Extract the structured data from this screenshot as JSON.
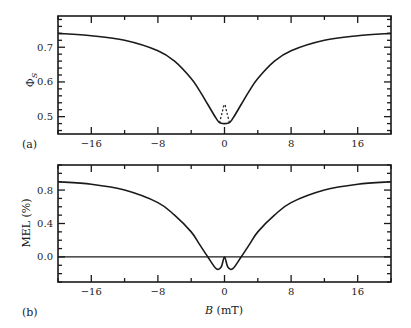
{
  "chart_data": [
    {
      "type": "line",
      "panel_label": "(a)",
      "title": "",
      "xlabel": "",
      "ylabel": "Φ_S",
      "xlim": [
        -20,
        20
      ],
      "ylim": [
        0.45,
        0.79
      ],
      "xticks": [
        -16,
        -8,
        0,
        8,
        16
      ],
      "yticks": [
        0.5,
        0.6,
        0.7
      ],
      "series": [
        {
          "name": "Φ_S (solid)",
          "style": "solid",
          "x": [
            -20,
            -16,
            -12,
            -8,
            -6,
            -4,
            -3,
            -2,
            -1,
            -0.5,
            0.5,
            1,
            2,
            3,
            4,
            6,
            8,
            12,
            16,
            20
          ],
          "y": [
            0.74,
            0.733,
            0.72,
            0.69,
            0.66,
            0.61,
            0.575,
            0.535,
            0.495,
            0.482,
            0.482,
            0.495,
            0.535,
            0.575,
            0.61,
            0.66,
            0.69,
            0.72,
            0.733,
            0.74
          ]
        },
        {
          "name": "Φ_S (dashed, low-field)",
          "style": "dashed",
          "x": [
            -0.6,
            -0.3,
            0,
            0.3,
            0.6
          ],
          "y": [
            0.482,
            0.51,
            0.535,
            0.51,
            0.482
          ]
        }
      ]
    },
    {
      "type": "line",
      "panel_label": "(b)",
      "title": "",
      "xlabel": "B (mT)",
      "ylabel": "MEL (%)",
      "xlim": [
        -20,
        20
      ],
      "ylim": [
        -0.3,
        1.1
      ],
      "xticks": [
        -16,
        -8,
        0,
        8,
        16
      ],
      "yticks": [
        0.0,
        0.4,
        0.8
      ],
      "series": [
        {
          "name": "MEL",
          "style": "solid",
          "x": [
            -20,
            -16,
            -12,
            -8,
            -6,
            -4,
            -3,
            -2,
            -1,
            -0.4,
            0,
            0.4,
            1,
            2,
            3,
            4,
            6,
            8,
            12,
            16,
            20
          ],
          "y": [
            0.9,
            0.87,
            0.8,
            0.65,
            0.5,
            0.3,
            0.15,
            0.0,
            -0.14,
            -0.12,
            0.0,
            -0.12,
            -0.14,
            0.0,
            0.15,
            0.3,
            0.5,
            0.65,
            0.8,
            0.87,
            0.9
          ]
        },
        {
          "name": "zero line",
          "style": "solid",
          "x": [
            -20,
            20
          ],
          "y": [
            0,
            0
          ]
        }
      ]
    }
  ],
  "labels": {
    "panel_a": "(a)",
    "panel_b": "(b)",
    "ylabel_a_main": "Φ",
    "ylabel_a_sub": "S",
    "ylabel_b": "MEL (%)",
    "xlabel_b_var": "B",
    "xlabel_b_unit": " (mT)",
    "xticks": [
      "−16",
      "−8",
      "0",
      "8",
      "16"
    ],
    "yticks_a": [
      "0.5",
      "0.6",
      "0.7"
    ],
    "yticks_b": [
      "0.0",
      "0.4",
      "0.8"
    ]
  },
  "colors": {
    "line": "#1a1a1a",
    "frame": "#1a1a1a",
    "background": "#ffffff"
  }
}
